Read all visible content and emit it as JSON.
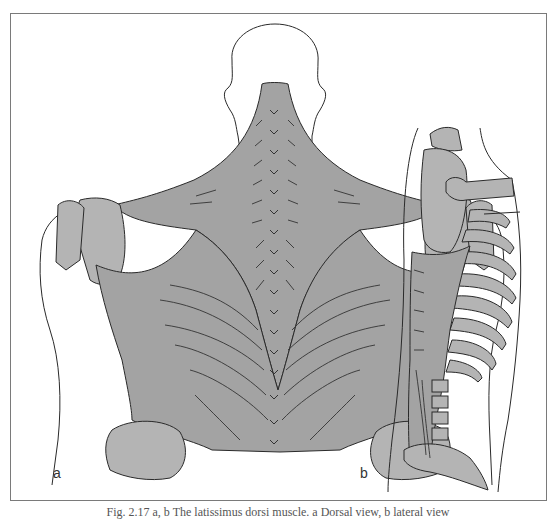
{
  "figure": {
    "panels": [
      {
        "label": "a",
        "view": "dorsal"
      },
      {
        "label": "b",
        "view": "lateral"
      }
    ],
    "caption": "Fig. 2.17 a, b  The latissimus dorsi muscle. a Dorsal view, b lateral view"
  },
  "colors": {
    "muscle_fill": "#a3a3a3",
    "bone_fill": "#b4b4b4",
    "outline": "#2a2a2a",
    "frame": "#7a7a7a"
  }
}
